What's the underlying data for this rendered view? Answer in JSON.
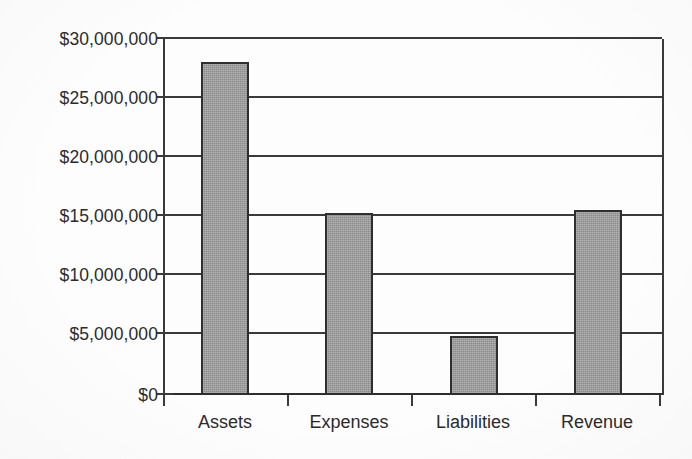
{
  "chart_data": {
    "type": "bar",
    "title": "",
    "subtitle": "",
    "xlabel": "",
    "ylabel": "",
    "categories": [
      "Assets",
      "Expenses",
      "Liabilities",
      "Revenue"
    ],
    "values": [
      28050000,
      15350000,
      5000000,
      15600000
    ],
    "series": [
      {
        "name": "Amount",
        "values": [
          28050000,
          15350000,
          5000000,
          15600000
        ]
      }
    ],
    "ylim": [
      0,
      30000000
    ],
    "ytick_values": [
      0,
      5000000,
      10000000,
      15000000,
      20000000,
      25000000,
      30000000
    ],
    "ytick_labels": [
      "$0",
      "$5,000,000",
      "$10,000,000",
      "$15,000,000",
      "$20,000,000",
      "$25,000,000",
      "$30,000,000"
    ],
    "grid": true,
    "grid_orientation": "horizontal",
    "legend": false,
    "legend_position": "none",
    "bar_fill_color": "#9b9b9b",
    "bar_border_color": "#2f2f2f",
    "axis_color": "#3a3a3a",
    "background_color": "#fdfdfd",
    "annotations": []
  },
  "axis": {
    "y_ticks": [
      {
        "label": "$30,000,000",
        "value": 30000000
      },
      {
        "label": "$25,000,000",
        "value": 25000000
      },
      {
        "label": "$20,000,000",
        "value": 20000000
      },
      {
        "label": "$15,000,000",
        "value": 15000000
      },
      {
        "label": "$10,000,000",
        "value": 10000000
      },
      {
        "label": "$5,000,000",
        "value": 5000000
      },
      {
        "label": "$0",
        "value": 0
      }
    ],
    "x_ticks": [
      {
        "label": "Assets"
      },
      {
        "label": "Expenses"
      },
      {
        "label": "Liabilities"
      },
      {
        "label": "Revenue"
      }
    ]
  }
}
